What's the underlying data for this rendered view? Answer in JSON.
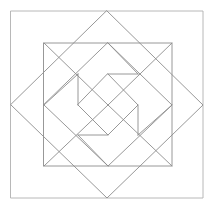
{
  "figure": {
    "type": "line-diagram",
    "width": 215,
    "height": 209,
    "background_color": "#ffffff",
    "stroke_color": "#8c8c8c",
    "stroke_color_outer": "#b0b0b0",
    "stroke_width": 0.9,
    "layers": [
      {
        "name": "outer-square-frame",
        "shape": "square",
        "points": "11,11 203,11 203,198 11,198"
      },
      {
        "name": "large-diamond",
        "shape": "diamond",
        "points": "107,11 203,105 107,198 11,105"
      },
      {
        "name": "inner-square",
        "shape": "square",
        "points": "44,43 172,43 172,166 44,166"
      },
      {
        "name": "medium-diamond",
        "shape": "diamond",
        "points": "108,43 172,105 108,166 44,105"
      },
      {
        "name": "pinwheel-square",
        "shape": "rotated-square",
        "points": "108,74 138,105 108,135 78,105"
      }
    ],
    "pinwheel_tails": [
      {
        "name": "tail-top-vertical",
        "from": "78,74",
        "to": "78,105"
      },
      {
        "name": "tail-right-horizontal",
        "from": "108,74",
        "to": "138,74"
      },
      {
        "name": "tail-bottom-vertical",
        "from": "138,105",
        "to": "138,135"
      },
      {
        "name": "tail-left-horizontal",
        "from": "78,135",
        "to": "108,135"
      }
    ]
  }
}
